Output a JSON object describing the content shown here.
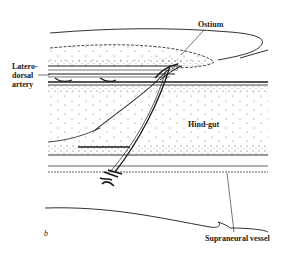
{
  "figure": {
    "panel_letter": "b",
    "labels": {
      "ostium": "Ostium",
      "laterodorsal_artery_line1": "Latero-",
      "laterodorsal_artery_line2": "dorsal",
      "laterodorsal_artery_line3": "artery",
      "hind_gut": "Hind-gut",
      "supraneural_vessel": "Supraneural vessel"
    },
    "colors": {
      "ink": "#1a1a1a",
      "background": "#ffffff"
    }
  }
}
